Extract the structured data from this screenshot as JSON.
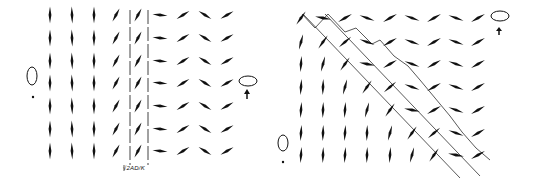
{
  "figure": {
    "left_panel": {
      "title": "Planar domain wall with boundary layer",
      "boundary_label": "√2AD/K",
      "left_state": {
        "icon": "ellipse-vertical",
        "marker": "dot"
      },
      "right_state": {
        "icon": "ellipse-horizontal",
        "marker": "up-arrow"
      },
      "grid": {
        "rows": 7,
        "columns": 8,
        "column_orientations_deg": [
          90,
          90,
          90,
          60,
          60,
          180,
          30,
          150,
          30
        ],
        "column_x": [
          50,
          72,
          94,
          115,
          137,
          160,
          183,
          205,
          228
        ],
        "row_y": [
          15,
          38,
          61,
          83,
          106,
          129,
          151
        ]
      },
      "dashed_lines_x": [
        130,
        148
      ]
    },
    "right_panel": {
      "title": "Diagonal domain wall",
      "left_state": {
        "icon": "ellipse-vertical",
        "marker": "dot"
      },
      "right_state": {
        "icon": "ellipse-horizontal",
        "marker": "up-arrow"
      },
      "grid": {
        "rows": 7,
        "columns": 9,
        "column_x": [
          301,
          323,
          345,
          367,
          390,
          412,
          434,
          456,
          478
        ],
        "row_y": [
          18,
          42,
          64,
          87,
          110,
          133,
          155
        ]
      },
      "diagonal_band": {
        "from": [
          303,
          14
        ],
        "to": [
          480,
          175
        ],
        "width": 22
      }
    },
    "colors": {
      "ink": "#111111",
      "background": "#ffffff"
    }
  }
}
